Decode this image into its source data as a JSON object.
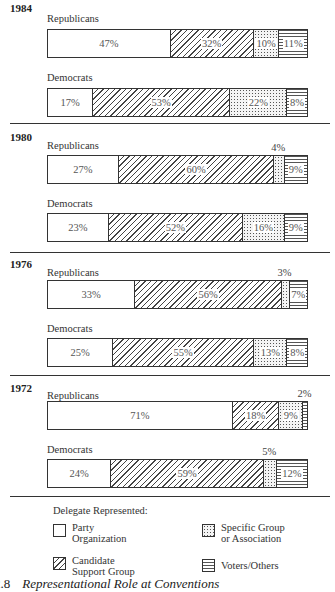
{
  "chart_data": {
    "type": "bar",
    "orientation": "horizontal-stacked-100",
    "title": "Representational Role at Conventions",
    "caption_number": "2.8",
    "legend_title": "Delegate Represented:",
    "legend": [
      {
        "key": "party",
        "label_line1": "Party",
        "label_line2": "Organization",
        "pattern": "blank"
      },
      {
        "key": "specific",
        "label_line1": "Specific Group",
        "label_line2": "or Association",
        "pattern": "stipple"
      },
      {
        "key": "candidate",
        "label_line1": "Candidate",
        "label_line2": "Support Group",
        "pattern": "diagonal-hatch"
      },
      {
        "key": "voters",
        "label_line1": "Voters/Others",
        "label_line2": "",
        "pattern": "horizontal-lines"
      }
    ],
    "categories": [
      "Party Organization",
      "Candidate Support Group",
      "Specific Group or Association",
      "Voters/Others"
    ],
    "years": [
      {
        "year": "1984",
        "parties": [
          {
            "party": "Republicans",
            "values": [
              47,
              32,
              10,
              11
            ],
            "labels": [
              "47%",
              "32%",
              "10%",
              "11%"
            ],
            "outside": [
              false,
              false,
              false,
              false
            ]
          },
          {
            "party": "Democrats",
            "values": [
              17,
              53,
              22,
              8
            ],
            "labels": [
              "17%",
              "53%",
              "22%",
              "8%"
            ],
            "outside": [
              false,
              false,
              false,
              false
            ]
          }
        ]
      },
      {
        "year": "1980",
        "parties": [
          {
            "party": "Republicans",
            "values": [
              27,
              60,
              4,
              9
            ],
            "labels": [
              "27%",
              "60%",
              "4%",
              "9%"
            ],
            "outside": [
              false,
              false,
              true,
              false
            ]
          },
          {
            "party": "Democrats",
            "values": [
              23,
              52,
              16,
              9
            ],
            "labels": [
              "23%",
              "52%",
              "16%",
              "9%"
            ],
            "outside": [
              false,
              false,
              false,
              false
            ]
          }
        ]
      },
      {
        "year": "1976",
        "parties": [
          {
            "party": "Republicans",
            "values": [
              33,
              56,
              3,
              7
            ],
            "labels": [
              "33%",
              "56%",
              "3%",
              "7%"
            ],
            "outside": [
              false,
              false,
              true,
              false
            ]
          },
          {
            "party": "Democrats",
            "values": [
              25,
              55,
              13,
              8
            ],
            "labels": [
              "25%",
              "55%",
              "13%",
              "8%"
            ],
            "outside": [
              false,
              false,
              false,
              false
            ]
          }
        ]
      },
      {
        "year": "1972",
        "parties": [
          {
            "party": "Republicans",
            "values": [
              71,
              18,
              9,
              2
            ],
            "labels": [
              "71%",
              "18%",
              "9%",
              "2%"
            ],
            "outside": [
              false,
              false,
              false,
              true
            ]
          },
          {
            "party": "Democrats",
            "values": [
              24,
              59,
              5,
              12
            ],
            "labels": [
              "24%",
              "59%",
              "5%",
              "12%"
            ],
            "outside": [
              false,
              false,
              true,
              false
            ]
          }
        ]
      }
    ],
    "xlabel": "",
    "ylabel": "",
    "xlim": [
      0,
      100
    ],
    "grid": false,
    "legend_position": "bottom"
  }
}
